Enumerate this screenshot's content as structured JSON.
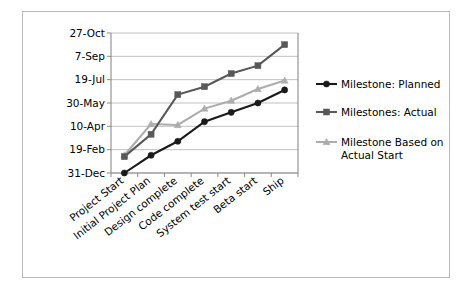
{
  "chart_data": {
    "type": "line",
    "title": "",
    "xlabel": "",
    "ylabel": "",
    "categories": [
      "Project Start",
      "Initial Project Plan",
      "Design complete",
      "Code complete",
      "System test start",
      "Beta start",
      "Ship"
    ],
    "y_tick_labels": [
      "31-Dec",
      "19-Feb",
      "10-Apr",
      "30-May",
      "19-Jul",
      "7-Sep",
      "27-Oct"
    ],
    "y_tick_values": [
      0,
      50,
      100,
      150,
      200,
      250,
      300
    ],
    "ylim": [
      0,
      300
    ],
    "y_axis_note": "Days after 31-Dec baseline",
    "grid": true,
    "legend_position": "right",
    "series": [
      {
        "name": "Milestone: Planned",
        "color": "#1a1a1a",
        "marker": "circle",
        "values": [
          0,
          38,
          68,
          110,
          130,
          150,
          178
        ],
        "date_labels": [
          "31-Dec",
          "7-Feb",
          "9-Mar",
          "20-Apr",
          "10-May",
          "30-May",
          "27-Jun"
        ]
      },
      {
        "name": "Milestones: Actual",
        "color": "#58585a",
        "marker": "square",
        "values": [
          35,
          83,
          168,
          185,
          213,
          230,
          275
        ],
        "date_labels": [
          "4-Feb",
          "24-Mar",
          "17-Jun",
          "4-Jul",
          "1-Aug",
          "18-Aug",
          "2-Oct"
        ]
      },
      {
        "name": "Milestone Based on Actual Start",
        "color": "#adadad",
        "marker": "triangle",
        "values": [
          38,
          105,
          103,
          138,
          155,
          180,
          198
        ],
        "date_labels": [
          "7-Feb",
          "15-Apr",
          "13-Apr",
          "18-May",
          "4-Jun",
          "29-Jun",
          "17-Jul"
        ]
      }
    ],
    "legend_entries": [
      "Milestone: Planned",
      "Milestones: Actual",
      "Milestone Based on Actual Start"
    ],
    "legend_entry_lines": [
      [
        "Milestone: Planned"
      ],
      [
        "Milestones: Actual"
      ],
      [
        "Milestone Based on",
        "Actual Start"
      ]
    ]
  },
  "colors": {
    "planned": "#1a1a1a",
    "actual": "#58585a",
    "based_on_actual_start": "#adadad",
    "gridline": "#b0b0b0",
    "axis": "#8a8a8a",
    "frame_border": "#b9b9b9",
    "background": "#ffffff"
  }
}
